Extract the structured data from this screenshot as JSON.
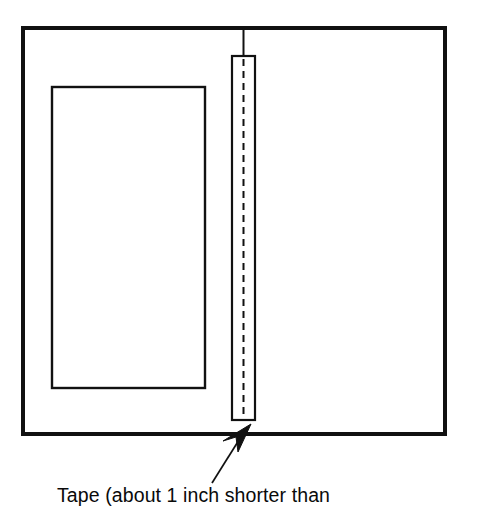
{
  "figure": {
    "background_color": "#ffffff",
    "line_color": "#111111",
    "caption": "Tape (about 1 inch shorter than",
    "parts": {
      "outer_panel_label": "open-book-outer-panel",
      "inner_panel_label": "left-page-inner-rectangle",
      "tape_strip_label": "vertical-tape-strip",
      "tape_center_label": "tape-center-dashed-line",
      "spine_tick_label": "spine-top-tick",
      "arrow_label": "tape-callout-arrow"
    },
    "geometry": {
      "outer_rect": {
        "x": 23,
        "y": 28,
        "width": 422,
        "height": 406,
        "stroke_width": 4
      },
      "inner_rect": {
        "x": 52,
        "y": 87,
        "width": 153,
        "height": 301,
        "stroke_width": 2.4
      },
      "tape_rect": {
        "x": 232,
        "y": 56,
        "width": 23,
        "height": 364,
        "stroke_width": 2.2
      },
      "tape_dash": {
        "x": 243,
        "y1": 58,
        "y2": 420,
        "dash": "7 5",
        "stroke_width": 2
      },
      "spine_tick": {
        "x": 243,
        "y1": 28,
        "y2": 56,
        "stroke_width": 2
      },
      "arrow_tip": {
        "x": 250,
        "y": 428
      },
      "arrow_tail": {
        "x": 212,
        "y": 483
      }
    },
    "colors": {
      "stroke": "#111111",
      "fill": "#ffffff",
      "text": "#0a0a0a"
    }
  }
}
